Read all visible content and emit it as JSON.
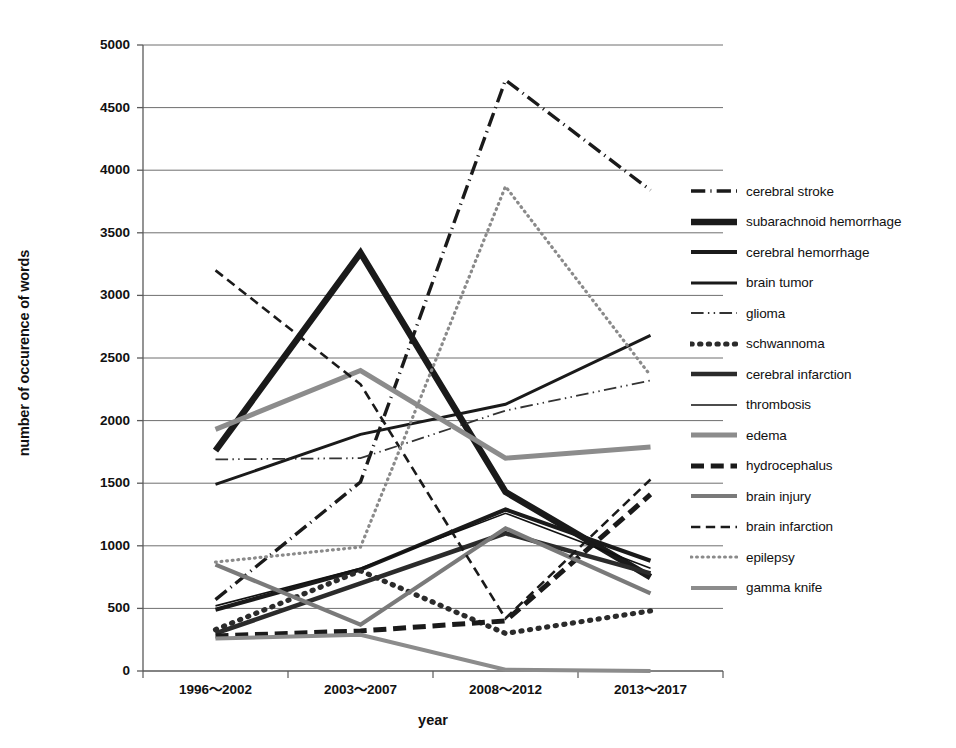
{
  "chart_data": {
    "type": "line",
    "title": "",
    "xlabel": "year",
    "ylabel": "number of occurence of words",
    "categories": [
      "1996～2002",
      "2003～2007",
      "2008～2012",
      "2013～2017"
    ],
    "ylim": [
      0,
      5000
    ],
    "ytick_values": [
      0,
      500,
      1000,
      1500,
      2000,
      2500,
      3000,
      3500,
      4000,
      4500,
      5000
    ],
    "ytick_labels": [
      "0",
      "500",
      "1000",
      "1500",
      "2000",
      "2500",
      "3000",
      "3500",
      "4000",
      "4500",
      "5000"
    ],
    "grid": true,
    "legend_position": "right",
    "series": [
      {
        "name": "cerebral stroke",
        "style": "dash-dot",
        "color": "#1a1a1a",
        "width": 3.4,
        "values": [
          570,
          1510,
          4720,
          3840
        ]
      },
      {
        "name": "subarachnoid hemorrhage",
        "style": "solid",
        "color": "#1a1a1a",
        "width": 6.5,
        "values": [
          1760,
          3340,
          1430,
          750
        ]
      },
      {
        "name": "cerebral hemorrhage",
        "style": "solid",
        "color": "#1a1a1a",
        "width": 4.2,
        "values": [
          490,
          810,
          1290,
          880
        ]
      },
      {
        "name": "brain tumor",
        "style": "solid",
        "color": "#1a1a1a",
        "width": 3.0,
        "values": [
          1490,
          1890,
          2130,
          2680
        ]
      },
      {
        "name": "glioma",
        "style": "dash-dot-thin",
        "color": "#333333",
        "width": 1.8,
        "values": [
          1690,
          1700,
          2080,
          2320
        ]
      },
      {
        "name": "schwannoma",
        "style": "dotted-thick",
        "color": "#2b2b2b",
        "width": 5.2,
        "values": [
          330,
          800,
          300,
          480
        ]
      },
      {
        "name": "cerebral infarction",
        "style": "solid",
        "color": "#2b2b2b",
        "width": 4.6,
        "values": [
          300,
          700,
          1100,
          780
        ]
      },
      {
        "name": "thrombosis",
        "style": "solid",
        "color": "#111111",
        "width": 1.6,
        "values": [
          520,
          820,
          1260,
          820
        ]
      },
      {
        "name": "edema",
        "style": "solid",
        "color": "#8c8c8c",
        "width": 5.0,
        "values": [
          1930,
          2400,
          1700,
          1790
        ]
      },
      {
        "name": "hydrocephalus",
        "style": "dashed-thick",
        "color": "#1a1a1a",
        "width": 5.0,
        "values": [
          280,
          320,
          400,
          1410
        ]
      },
      {
        "name": "brain injury",
        "style": "solid",
        "color": "#7a7a7a",
        "width": 4.2,
        "values": [
          850,
          370,
          1140,
          620
        ]
      },
      {
        "name": "brain infarction",
        "style": "dashed-thin",
        "color": "#1a1a1a",
        "width": 2.6,
        "values": [
          3200,
          2290,
          420,
          1530
        ]
      },
      {
        "name": "epilepsy",
        "style": "dotted-fine",
        "color": "#8a8a8a",
        "width": 3.2,
        "values": [
          870,
          990,
          3870,
          2360
        ]
      },
      {
        "name": "gamma knife",
        "style": "solid",
        "color": "#8c8c8c",
        "width": 4.0,
        "values": [
          260,
          290,
          10,
          0
        ]
      }
    ]
  },
  "axes": {
    "y_title": "number of occurence of words",
    "x_title": "year"
  },
  "legend": {
    "items": [
      {
        "label": "cerebral stroke"
      },
      {
        "label": "subarachnoid hemorrhage"
      },
      {
        "label": "cerebral hemorrhage"
      },
      {
        "label": "brain tumor"
      },
      {
        "label": "glioma"
      },
      {
        "label": "schwannoma"
      },
      {
        "label": "cerebral infarction"
      },
      {
        "label": "thrombosis"
      },
      {
        "label": "edema"
      },
      {
        "label": "hydrocephalus"
      },
      {
        "label": "brain injury"
      },
      {
        "label": "brain infarction"
      },
      {
        "label": "epilepsy"
      },
      {
        "label": "gamma knife"
      }
    ]
  }
}
